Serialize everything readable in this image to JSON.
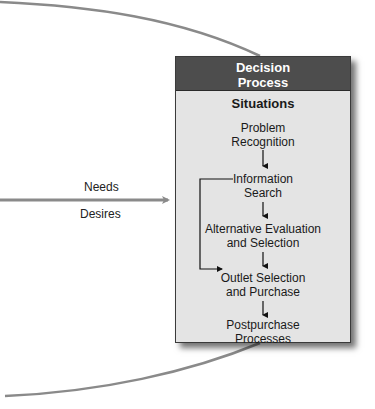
{
  "diagram": {
    "box_title_line1": "Decision",
    "box_title_line2": "Process",
    "section_title": "Situations",
    "steps": [
      {
        "line1": "Problem",
        "line2": "Recognition"
      },
      {
        "line1": "Information",
        "line2": "Search"
      },
      {
        "line1": "Alternative Evaluation",
        "line2": "and Selection"
      },
      {
        "line1": "Outlet Selection",
        "line2": "and Purchase"
      },
      {
        "line1": "Postpurchase",
        "line2": "Processes"
      }
    ],
    "input_labels": {
      "above_arrow": "Needs",
      "below_arrow": "Desires"
    },
    "colors": {
      "header_bg": "#4d4d4d",
      "box_bg": "#e4e4e4",
      "arrow_gray": "#8a8a8a"
    }
  }
}
